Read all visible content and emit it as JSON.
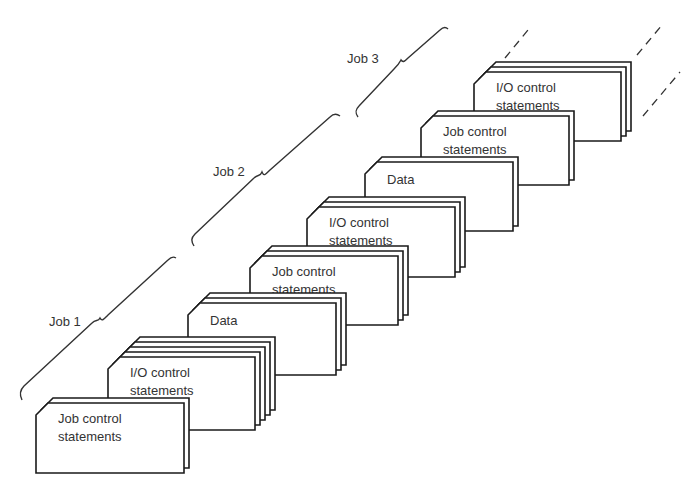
{
  "figure": {
    "type": "diagram"
  },
  "jobs": [
    {
      "label": "Job 1"
    },
    {
      "label": "Job 2"
    },
    {
      "label": "Job 3"
    }
  ],
  "decks": [
    {
      "job": "Job 1",
      "line1": "Job control",
      "line2": "statements",
      "x": 36,
      "y": 403,
      "w": 148,
      "h": 70,
      "back_cards": 1
    },
    {
      "job": "Job 1",
      "line1": "I/O control",
      "line2": "statements",
      "x": 108,
      "y": 357,
      "w": 147,
      "h": 73,
      "back_cards": 4
    },
    {
      "job": "Job 1",
      "line1": "Data",
      "line2": "",
      "x": 188,
      "y": 303,
      "w": 148,
      "h": 72,
      "back_cards": 2
    },
    {
      "job": "Job 2",
      "line1": "Job control",
      "line2": "statements",
      "x": 250,
      "y": 256,
      "w": 148,
      "h": 69,
      "back_cards": 2
    },
    {
      "job": "Job 2",
      "line1": "I/O control",
      "line2": "statements",
      "x": 307,
      "y": 207,
      "w": 148,
      "h": 70,
      "back_cards": 2
    },
    {
      "job": "Job 2",
      "line1": "Data",
      "line2": "",
      "x": 365,
      "y": 162,
      "w": 148,
      "h": 69,
      "back_cards": 1
    },
    {
      "job": "Job 3",
      "line1": "Job control",
      "line2": "statements",
      "x": 421,
      "y": 116,
      "w": 148,
      "h": 69,
      "back_cards": 1
    },
    {
      "job": "Job 3",
      "line1": "I/O control",
      "line2": "statements",
      "x": 474,
      "y": 72,
      "w": 147,
      "h": 69,
      "back_cards": 2
    }
  ],
  "continuation": "dashed lines indicate the deck continues"
}
